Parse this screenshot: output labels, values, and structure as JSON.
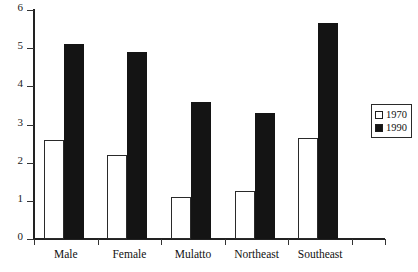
{
  "chart_data": {
    "type": "bar",
    "title": "",
    "subtitle": "",
    "xlabel": "",
    "ylabel": "",
    "categories": [
      "Male",
      "Female",
      "Mulatto",
      "Northeast",
      "Southeast"
    ],
    "series": [
      {
        "name": "1970",
        "values": [
          2.6,
          2.2,
          1.1,
          1.25,
          2.65
        ],
        "color": "#ffffff",
        "swatch": "hollow"
      },
      {
        "name": "1990",
        "values": [
          5.1,
          4.9,
          3.6,
          3.3,
          5.65
        ],
        "color": "#141414",
        "swatch": "filled"
      }
    ],
    "ylim": [
      0,
      6
    ],
    "yticks": [
      0,
      1,
      2,
      3,
      4,
      5,
      6
    ],
    "ytick_labels": [
      "0",
      "1",
      "2",
      "3",
      "4",
      "5",
      "6"
    ],
    "grid": false,
    "legend_position": "right"
  },
  "legend": {
    "entries": [
      {
        "label": "1970"
      },
      {
        "label": "1990"
      }
    ]
  },
  "axis": {
    "y_labels": [
      "6",
      "5",
      "4",
      "3",
      "2",
      "1",
      "0"
    ]
  }
}
